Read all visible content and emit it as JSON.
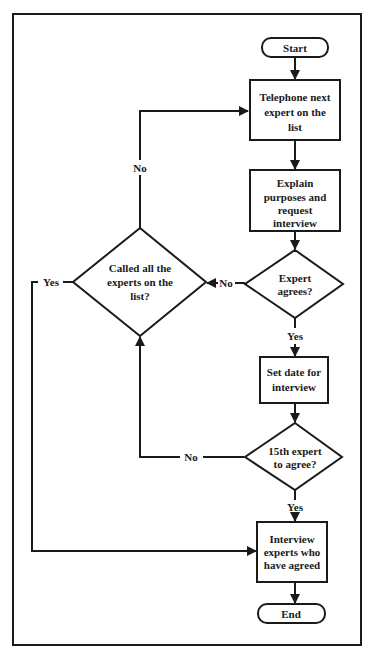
{
  "diagram": {
    "type": "flowchart",
    "nodes": {
      "start": {
        "kind": "terminal",
        "lines": [
          "Start"
        ]
      },
      "telephone": {
        "kind": "process",
        "lines": [
          "Telephone next",
          "expert on the",
          "list"
        ]
      },
      "explain": {
        "kind": "process",
        "lines": [
          "Explain",
          "purposes and",
          "request",
          "interview"
        ]
      },
      "expert_agrees": {
        "kind": "decision",
        "lines": [
          "Expert",
          "agrees?"
        ]
      },
      "called_all": {
        "kind": "decision",
        "lines": [
          "Called all the",
          "experts on the",
          "list?"
        ]
      },
      "set_date": {
        "kind": "process",
        "lines": [
          "Set date for",
          "interview"
        ]
      },
      "fifteenth": {
        "kind": "decision",
        "lines": [
          "15th expert",
          "to agree?"
        ]
      },
      "interview": {
        "kind": "process",
        "lines": [
          "Interview",
          "experts who",
          "have agreed"
        ]
      },
      "end": {
        "kind": "terminal",
        "lines": [
          "End"
        ]
      }
    },
    "edges": [
      {
        "from": "start",
        "to": "telephone",
        "label": ""
      },
      {
        "from": "telephone",
        "to": "explain",
        "label": ""
      },
      {
        "from": "explain",
        "to": "expert_agrees",
        "label": ""
      },
      {
        "from": "expert_agrees",
        "to": "called_all",
        "label": "No"
      },
      {
        "from": "expert_agrees",
        "to": "set_date",
        "label": "Yes"
      },
      {
        "from": "called_all",
        "to": "telephone",
        "label": "No"
      },
      {
        "from": "called_all",
        "to": "interview",
        "label": "Yes"
      },
      {
        "from": "set_date",
        "to": "fifteenth",
        "label": ""
      },
      {
        "from": "fifteenth",
        "to": "called_all",
        "label": "No"
      },
      {
        "from": "fifteenth",
        "to": "interview",
        "label": "Yes"
      },
      {
        "from": "interview",
        "to": "end",
        "label": ""
      }
    ],
    "edge_labels": {
      "expert_agrees_no": "No",
      "expert_agrees_yes": "Yes",
      "called_all_no": "No",
      "called_all_yes": "Yes",
      "fifteenth_no": "No",
      "fifteenth_yes": "Yes"
    }
  }
}
